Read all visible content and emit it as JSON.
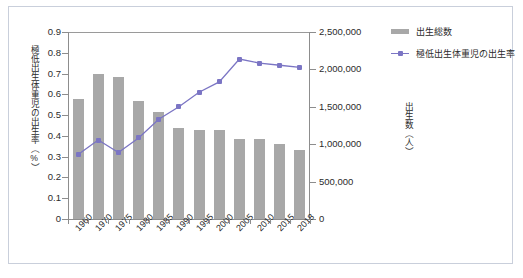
{
  "chart_data": {
    "type": "bar",
    "title": "",
    "categories": [
      "1960",
      "1970",
      "1975",
      "1980",
      "1985",
      "1990",
      "1995",
      "2000",
      "2005",
      "2010",
      "2015",
      "2018"
    ],
    "xlabel": "",
    "grid": false,
    "legend_position": "top-right",
    "series": [
      {
        "name": "出生総数",
        "type": "bar",
        "axis": "right",
        "color": "#a8a8a8",
        "values": [
          1606000,
          1934000,
          1901000,
          1577000,
          1432000,
          1222000,
          1187000,
          1191000,
          1063000,
          1071000,
          1006000,
          918000
        ]
      },
      {
        "name": "極低出生体重児の出生率",
        "type": "line",
        "axis": "left",
        "color": "#7b75c4",
        "values": [
          0.31,
          0.38,
          0.32,
          0.39,
          0.48,
          0.54,
          0.61,
          0.66,
          0.77,
          0.75,
          0.74,
          0.73
        ]
      }
    ],
    "left_axis": {
      "label": "極低出生体重児の出生率（%）",
      "ylim": [
        0,
        0.9
      ],
      "ticks": [
        "0",
        "0.1",
        "0.2",
        "0.3",
        "0.4",
        "0.5",
        "0.6",
        "0.7",
        "0.8",
        "0.9"
      ]
    },
    "right_axis": {
      "label": "出生数（人）",
      "ylim": [
        0,
        2500000
      ],
      "ticks": [
        "0",
        "500,000",
        "1,000,000",
        "1,500,000",
        "2,000,000",
        "2,500,000"
      ]
    }
  },
  "legend": {
    "items": [
      {
        "label": "出生総数",
        "marker": "bar-swatch"
      },
      {
        "label": "極低出生体重児の出生率",
        "marker": "line-marker-swatch"
      }
    ]
  }
}
